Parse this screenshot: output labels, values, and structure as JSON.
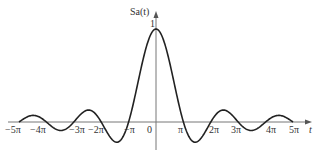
{
  "chart_data": {
    "type": "line",
    "title": "",
    "function": "Sa(t) = sin(t)/t",
    "ylabel": "Sa(t)",
    "xlabel": "t",
    "xlim": [
      -5.0,
      5.0
    ],
    "x_unit": "pi",
    "ylim": [
      -0.22,
      1.0
    ],
    "grid": false,
    "legend": null,
    "y_tick_labels": [
      "1"
    ],
    "origin_label": "0",
    "x_tick_labels": [
      "-5π",
      "-4π",
      "-3π",
      "-2π",
      "-π",
      "π",
      "2π",
      "3π",
      "4π",
      "5π"
    ],
    "x_tick_values_in_pi": [
      -5,
      -4,
      -3,
      -2,
      -1,
      1,
      2,
      3,
      4,
      5
    ],
    "x": [
      -5,
      -4.5,
      -4,
      -3.5,
      -3,
      -2.5,
      -2,
      -1.5,
      -1,
      -0.5,
      0,
      0.5,
      1,
      1.5,
      2,
      2.5,
      3,
      3.5,
      4,
      4.5,
      5
    ],
    "values": [
      0,
      0.071,
      0,
      -0.091,
      0,
      0.127,
      0,
      -0.212,
      0,
      0.637,
      1,
      0.637,
      0,
      -0.212,
      0,
      0.127,
      0,
      -0.091,
      0,
      0.071,
      0
    ],
    "series": [
      {
        "name": "Sa(t)",
        "color": "#222222"
      }
    ]
  },
  "labels": {
    "ylabel": "Sa(t)",
    "xlabel": "t",
    "y_one": "1",
    "origin": "0",
    "ticks": [
      "−5π",
      "−4π",
      "−3π",
      "−2π",
      "−π",
      "π",
      "2π",
      "3π",
      "4π",
      "5π"
    ]
  }
}
